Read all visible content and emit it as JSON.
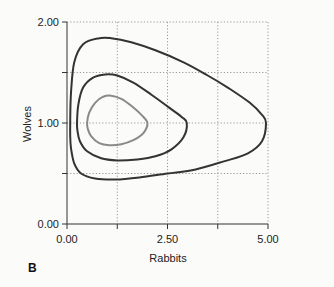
{
  "chart_data": {
    "type": "line",
    "subtype": "phase-plane",
    "panel_label": "B",
    "title": "",
    "xlabel": "Rabbits",
    "ylabel": "Wolves",
    "xlim": [
      0,
      5
    ],
    "ylim": [
      0,
      2
    ],
    "x_ticks": [
      0,
      1.25,
      2.5,
      3.75,
      5
    ],
    "x_tick_labels": [
      "0.00",
      "",
      "2.50",
      "",
      "5.00"
    ],
    "y_ticks": [
      0,
      0.5,
      1,
      1.5,
      2
    ],
    "y_tick_labels": [
      "0.00",
      "",
      "1.00",
      "",
      "2.00"
    ],
    "grid": true,
    "grid_style": "dotted",
    "legend": null,
    "series": [
      {
        "name": "orbit-inner",
        "color": "#8a8a8a",
        "closed": true,
        "points": [
          [
            0.5,
            1.0
          ],
          [
            0.55,
            1.1
          ],
          [
            0.7,
            1.2
          ],
          [
            0.9,
            1.26
          ],
          [
            1.1,
            1.27
          ],
          [
            1.35,
            1.24
          ],
          [
            1.6,
            1.17
          ],
          [
            1.85,
            1.08
          ],
          [
            2.0,
            1.0
          ],
          [
            1.9,
            0.9
          ],
          [
            1.65,
            0.83
          ],
          [
            1.35,
            0.79
          ],
          [
            1.05,
            0.78
          ],
          [
            0.8,
            0.8
          ],
          [
            0.6,
            0.87
          ],
          [
            0.52,
            0.94
          ]
        ]
      },
      {
        "name": "orbit-middle",
        "color": "#333333",
        "closed": true,
        "points": [
          [
            0.25,
            1.0
          ],
          [
            0.28,
            1.18
          ],
          [
            0.4,
            1.35
          ],
          [
            0.65,
            1.45
          ],
          [
            0.95,
            1.48
          ],
          [
            1.25,
            1.47
          ],
          [
            1.65,
            1.4
          ],
          [
            2.1,
            1.28
          ],
          [
            2.55,
            1.15
          ],
          [
            2.85,
            1.06
          ],
          [
            2.98,
            1.0
          ],
          [
            2.9,
            0.86
          ],
          [
            2.6,
            0.74
          ],
          [
            2.2,
            0.67
          ],
          [
            1.75,
            0.64
          ],
          [
            1.25,
            0.63
          ],
          [
            0.85,
            0.65
          ],
          [
            0.5,
            0.72
          ],
          [
            0.32,
            0.82
          ],
          [
            0.26,
            0.92
          ]
        ]
      },
      {
        "name": "orbit-outer",
        "color": "#333333",
        "closed": true,
        "points": [
          [
            0.08,
            1.0
          ],
          [
            0.1,
            1.3
          ],
          [
            0.18,
            1.6
          ],
          [
            0.4,
            1.78
          ],
          [
            0.8,
            1.84
          ],
          [
            1.1,
            1.84
          ],
          [
            1.6,
            1.8
          ],
          [
            2.2,
            1.72
          ],
          [
            2.9,
            1.6
          ],
          [
            3.5,
            1.47
          ],
          [
            4.0,
            1.35
          ],
          [
            4.55,
            1.2
          ],
          [
            4.85,
            1.08
          ],
          [
            4.95,
            1.0
          ],
          [
            4.85,
            0.82
          ],
          [
            4.5,
            0.7
          ],
          [
            3.9,
            0.62
          ],
          [
            3.2,
            0.54
          ],
          [
            2.5,
            0.5
          ],
          [
            1.8,
            0.46
          ],
          [
            1.2,
            0.44
          ],
          [
            0.7,
            0.45
          ],
          [
            0.35,
            0.5
          ],
          [
            0.18,
            0.6
          ],
          [
            0.1,
            0.75
          ],
          [
            0.08,
            0.88
          ]
        ]
      }
    ]
  },
  "plot_area_px": {
    "x0": 67,
    "x1": 268,
    "y0": 224,
    "y1": 22
  }
}
